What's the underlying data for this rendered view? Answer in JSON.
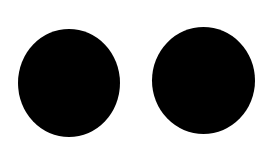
{
  "canvas": {
    "width": 273,
    "height": 152,
    "background": "#ffffff"
  },
  "shapes": [
    {
      "name": "left-circle",
      "type": "circle",
      "color": "#000000",
      "left": 18,
      "top": 29,
      "width": 102,
      "height": 108
    },
    {
      "name": "right-circle",
      "type": "circle",
      "color": "#000000",
      "left": 152,
      "top": 27,
      "width": 103,
      "height": 107
    }
  ]
}
